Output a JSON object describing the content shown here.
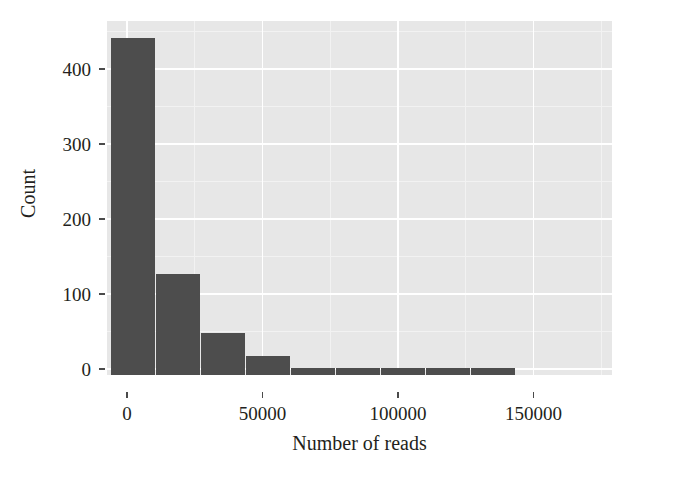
{
  "chart_data": {
    "type": "bar",
    "title": "",
    "subtitle": "",
    "xlabel": "Number of reads",
    "ylabel": "Count",
    "xlim": [
      -7400,
      179000
    ],
    "ylim": [
      -8,
      464
    ],
    "xticks": [
      0,
      50000,
      100000,
      150000
    ],
    "xtick_labels": [
      "0",
      "50000",
      "100000",
      "150000"
    ],
    "yticks": [
      0,
      100,
      200,
      300,
      400
    ],
    "ytick_labels": [
      "0",
      "100",
      "200",
      "300",
      "400"
    ],
    "grid": true,
    "legend": "none",
    "bin_width": 16600,
    "bin_edges": [
      -5900,
      10700,
      27300,
      43900,
      60500,
      77100,
      93700,
      110300,
      126900,
      143500
    ],
    "bin_centers": [
      2400,
      19000,
      35600,
      52200,
      68800,
      85400,
      102000,
      118600,
      135200
    ],
    "values": [
      441,
      127,
      48,
      18,
      1,
      1,
      1,
      1,
      1
    ],
    "categories": [
      "2400",
      "19000",
      "35600",
      "52200",
      "68800",
      "85400",
      "102000",
      "118600",
      "135200"
    ],
    "series": [
      {
        "name": "Number of reads",
        "values": [
          441,
          127,
          48,
          18,
          1,
          1,
          1,
          1,
          1
        ]
      }
    ],
    "colors": {
      "bar": "#4d4d4d",
      "panel_background": "#e7e7e7",
      "gridline_major": "#ffffff",
      "gridline_minor": "#f2f2f2",
      "figure_background": "#ffffff",
      "text": "#231f20",
      "axis": "#4a4a4a"
    }
  }
}
